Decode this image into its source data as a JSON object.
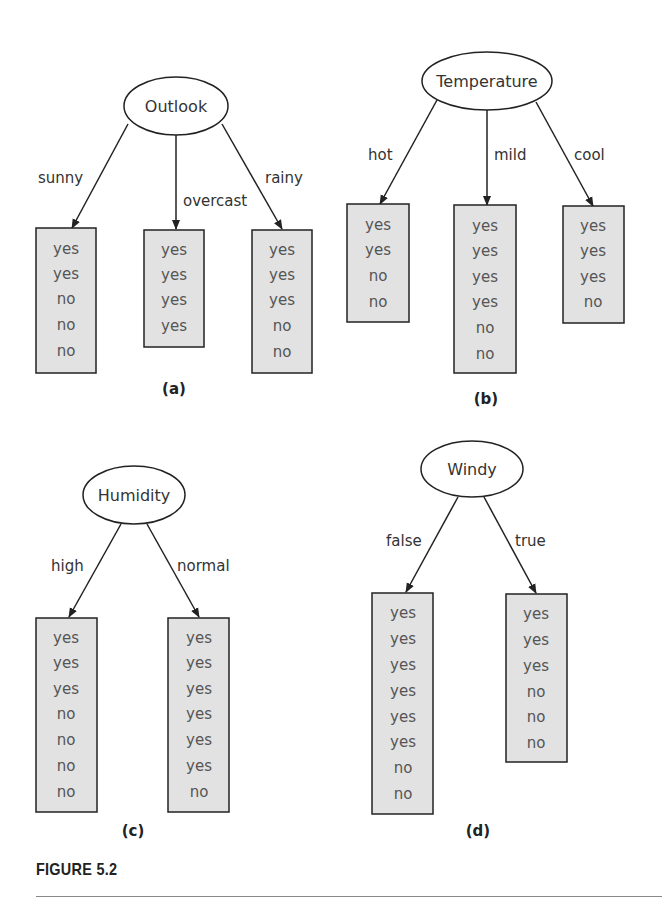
{
  "figure": {
    "caption": "FIGURE 5.2",
    "colors": {
      "leaf_fill": "#e2e2e2",
      "stroke": "#222222",
      "leaf_text": "#555555"
    },
    "panels": [
      {
        "label": "(a)",
        "root": "Outlook",
        "branches": [
          {
            "edge": "sunny",
            "leaf": [
              "yes",
              "yes",
              "no",
              "no",
              "no"
            ]
          },
          {
            "edge": "overcast",
            "leaf": [
              "yes",
              "yes",
              "yes",
              "yes"
            ]
          },
          {
            "edge": "rainy",
            "leaf": [
              "yes",
              "yes",
              "yes",
              "no",
              "no"
            ]
          }
        ]
      },
      {
        "label": "(b)",
        "root": "Temperature",
        "branches": [
          {
            "edge": "hot",
            "leaf": [
              "yes",
              "yes",
              "no",
              "no"
            ]
          },
          {
            "edge": "mild",
            "leaf": [
              "yes",
              "yes",
              "yes",
              "yes",
              "no",
              "no"
            ]
          },
          {
            "edge": "cool",
            "leaf": [
              "yes",
              "yes",
              "yes",
              "no"
            ]
          }
        ]
      },
      {
        "label": "(c)",
        "root": "Humidity",
        "branches": [
          {
            "edge": "high",
            "leaf": [
              "yes",
              "yes",
              "yes",
              "no",
              "no",
              "no",
              "no"
            ]
          },
          {
            "edge": "normal",
            "leaf": [
              "yes",
              "yes",
              "yes",
              "yes",
              "yes",
              "yes",
              "no"
            ]
          }
        ]
      },
      {
        "label": "(d)",
        "root": "Windy",
        "branches": [
          {
            "edge": "false",
            "leaf": [
              "yes",
              "yes",
              "yes",
              "yes",
              "yes",
              "yes",
              "no",
              "no"
            ]
          },
          {
            "edge": "true",
            "leaf": [
              "yes",
              "yes",
              "yes",
              "no",
              "no",
              "no"
            ]
          }
        ]
      }
    ]
  }
}
